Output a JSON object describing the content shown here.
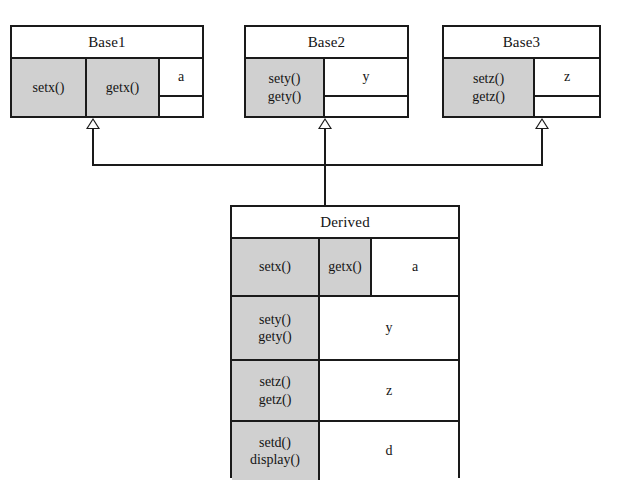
{
  "diagram": {
    "background_color": "#ffffff",
    "line_color": "#1a1a1a",
    "shaded_cell_color": "#d0d0d0",
    "white_cell_color": "#ffffff"
  },
  "classes": {
    "base1": {
      "name": "Base1",
      "methods_row": {
        "setx": "setx()",
        "getx": "getx()"
      },
      "attribute": "a",
      "empty_cell": ""
    },
    "base2": {
      "name": "Base2",
      "methods": "sety()\ngety()",
      "attribute": "y",
      "empty_cell": ""
    },
    "base3": {
      "name": "Base3",
      "methods": "setz()\ngetz()",
      "attribute": "z",
      "empty_cell": ""
    },
    "derived": {
      "name": "Derived",
      "rows": [
        {
          "method_left": "setx()",
          "method_right": "getx()",
          "attribute": "a"
        },
        {
          "methods": "sety()\ngety()",
          "attribute": "y"
        },
        {
          "methods": "setz()\ngetz()",
          "attribute": "z"
        },
        {
          "methods": "setd()\ndisplay()",
          "attribute": "d"
        }
      ]
    }
  },
  "connectors": {
    "relationship": "generalization",
    "arrow_type": "hollow-triangle",
    "count": 3
  }
}
